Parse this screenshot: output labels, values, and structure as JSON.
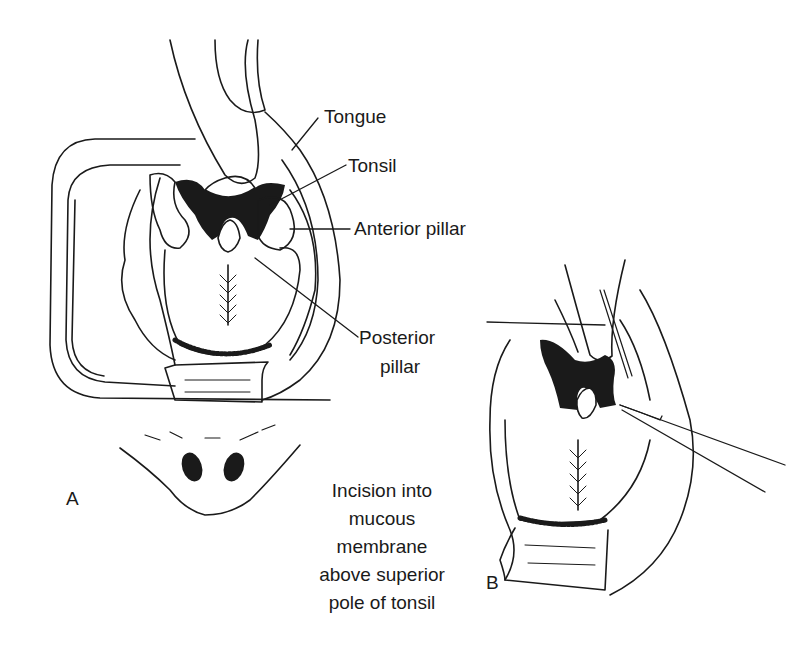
{
  "figure": {
    "panels": [
      {
        "id": "A",
        "label": "A"
      },
      {
        "id": "B",
        "label": "B"
      }
    ],
    "labels": {
      "tongue": "Tongue",
      "tonsil": "Tonsil",
      "anterior_pillar": "Anterior pillar",
      "posterior_pillar_line1": "Posterior",
      "posterior_pillar_line2": "pillar"
    },
    "caption_b": {
      "lines": [
        "Incision into",
        "mucous",
        "membrane",
        "above superior",
        "pole of tonsil"
      ]
    },
    "colors": {
      "ink": "#1a1a1a",
      "background": "#ffffff"
    }
  }
}
